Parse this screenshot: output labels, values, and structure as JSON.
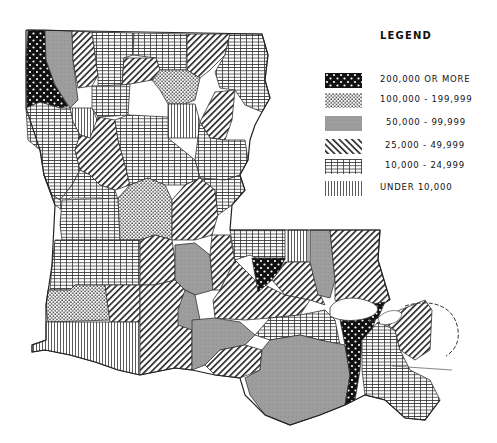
{
  "map": {
    "subject": "Louisiana parishes by population",
    "legend": {
      "title": "LEGEND",
      "items": [
        {
          "id": "p200k",
          "label": "200,000 OR MORE",
          "pattern": "black-with-white-dots"
        },
        {
          "id": "p100k",
          "label": "100,000 - 199,999",
          "pattern": "fine-dots"
        },
        {
          "id": "p50k",
          "label": "50,000 - 99,999",
          "pattern": "solid-gray"
        },
        {
          "id": "p25k",
          "label": "25,000 - 49,999",
          "pattern": "diagonal-hatch"
        },
        {
          "id": "p10k",
          "label": "10,000 - 24,999",
          "pattern": "grid-hatch"
        },
        {
          "id": "pu10k",
          "label": "UNDER 10,000",
          "pattern": "vertical-lines"
        }
      ]
    },
    "colors": {
      "ink": "#111111",
      "gray_fill": "#9a9a9a",
      "background": "#ffffff"
    }
  }
}
